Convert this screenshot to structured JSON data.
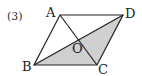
{
  "problem_number": "(3)",
  "figure": {
    "type": "parallelogram",
    "vertices": {
      "A": {
        "label": "A",
        "x": 60,
        "y": 15
      },
      "B": {
        "label": "B",
        "x": 34,
        "y": 65
      },
      "C": {
        "label": "C",
        "x": 97,
        "y": 65
      },
      "D": {
        "label": "D",
        "x": 123,
        "y": 15
      }
    },
    "intersection": {
      "label": "O"
    },
    "diagonals": [
      "AC",
      "BD"
    ],
    "shaded_region": "triangle BCD",
    "colors": {
      "line": "#222222",
      "shade": "#d0d0d0"
    }
  }
}
